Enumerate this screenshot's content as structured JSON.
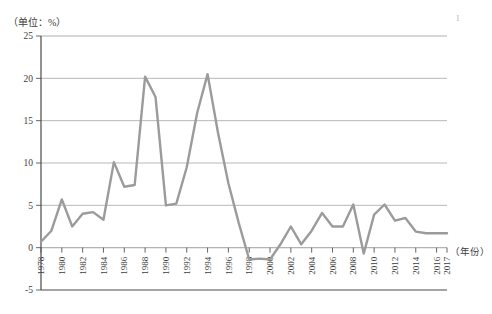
{
  "chart_data": {
    "type": "line",
    "title": "",
    "unit_label": "（单位：%）",
    "xlabel": "（年份）",
    "ylabel": "",
    "ylim": [
      -5,
      25
    ],
    "yticks": [
      -5,
      0,
      5,
      10,
      15,
      20,
      25
    ],
    "ytick_labels": [
      "-5",
      "0",
      "5",
      "10",
      "15",
      "20",
      "25"
    ],
    "grid": true,
    "grid_axis": "y",
    "legend": "none",
    "xlim": [
      1978,
      2017
    ],
    "xtick_labels": [
      "1978",
      "1980",
      "1982",
      "1984",
      "1986",
      "1988",
      "1990",
      "1992",
      "1994",
      "1996",
      "1998",
      "2000",
      "2002",
      "2004",
      "2006",
      "2008",
      "2010",
      "2012",
      "2014",
      "2016",
      "2017"
    ],
    "x": [
      1978,
      1979,
      1980,
      1981,
      1982,
      1983,
      1984,
      1985,
      1986,
      1987,
      1988,
      1989,
      1990,
      1991,
      1992,
      1993,
      1994,
      1995,
      1996,
      1997,
      1998,
      1999,
      2000,
      2001,
      2002,
      2003,
      2004,
      2005,
      2006,
      2007,
      2008,
      2009,
      2010,
      2011,
      2012,
      2013,
      2014,
      2015,
      2016,
      2017
    ],
    "values": [
      0.7,
      2.0,
      5.7,
      2.5,
      4.0,
      4.2,
      3.3,
      10.1,
      7.2,
      7.4,
      20.2,
      17.8,
      5.0,
      5.2,
      9.5,
      15.9,
      20.5,
      13.6,
      7.6,
      2.9,
      -1.4,
      -1.3,
      -1.4,
      0.4,
      2.5,
      0.4,
      2.0,
      4.1,
      2.5,
      2.5,
      5.1,
      -0.7,
      3.9,
      5.1,
      3.2,
      3.5,
      1.9,
      1.7,
      1.7,
      1.7
    ],
    "series_color": "#9b9b9b",
    "series_name": "",
    "annotations": [],
    "corner_mark": "1"
  }
}
